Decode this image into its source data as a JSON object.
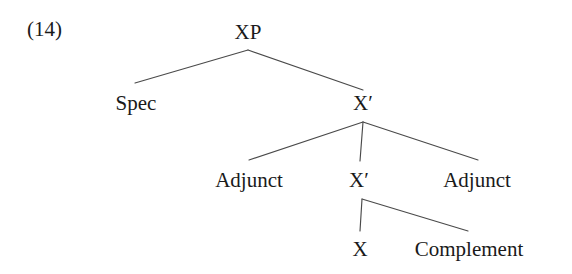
{
  "figure": {
    "example_number": "(14)",
    "type": "x-bar-syntax-tree",
    "background_color": "#ffffff",
    "line_color": "#4a4a4a",
    "text_color": "#1a1a1a"
  },
  "nodes": {
    "xp": "XP",
    "spec": "Spec",
    "xbar_top": "X′",
    "adjunct_left": "Adjunct",
    "xbar_mid": "X′",
    "adjunct_right": "Adjunct",
    "x_head": "X",
    "complement": "Complement"
  },
  "edges": [
    {
      "name": "xp-to-spec",
      "from": "xp",
      "to": "spec",
      "x1": 248,
      "y1": 50,
      "x2": 135,
      "y2": 83
    },
    {
      "name": "xp-to-xbar-top",
      "from": "xp",
      "to": "xbar_top",
      "x1": 248,
      "y1": 50,
      "x2": 363,
      "y2": 90
    },
    {
      "name": "xbar-top-to-adjunct-l",
      "from": "xbar_top",
      "to": "adjunct_left",
      "x1": 363,
      "y1": 122,
      "x2": 249,
      "y2": 160
    },
    {
      "name": "xbar-top-to-xbar-mid",
      "from": "xbar_top",
      "to": "xbar_mid",
      "x1": 363,
      "y1": 122,
      "x2": 360,
      "y2": 161
    },
    {
      "name": "xbar-top-to-adjunct-r",
      "from": "xbar_top",
      "to": "adjunct_right",
      "x1": 363,
      "y1": 122,
      "x2": 478,
      "y2": 160
    },
    {
      "name": "xbar-mid-to-x",
      "from": "xbar_mid",
      "to": "x_head",
      "x1": 362,
      "y1": 199,
      "x2": 360,
      "y2": 231
    },
    {
      "name": "xbar-mid-to-complement",
      "from": "xbar_mid",
      "to": "complement",
      "x1": 362,
      "y1": 199,
      "x2": 468,
      "y2": 231
    }
  ]
}
